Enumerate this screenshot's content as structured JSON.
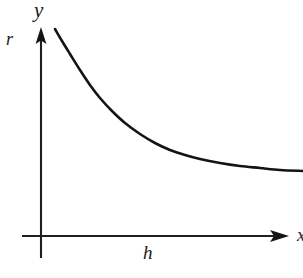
{
  "figure": {
    "background_color": "#ffffff",
    "ink_color": "#1a1a1a",
    "width": 303,
    "height": 278
  },
  "labels": {
    "y_axis_top": "y",
    "y_axis_side": "r",
    "x_axis_under": "h",
    "x_axis_end": "x"
  },
  "chart_data": {
    "type": "line",
    "title": "",
    "xlabel": "h",
    "ylabel": "r",
    "axis_tip_labels": {
      "vertical": "y",
      "horizontal": "x"
    },
    "grid": false,
    "legend": false,
    "ticks": {
      "x": [],
      "y": []
    },
    "origin_px": {
      "x": 41,
      "y": 236
    },
    "xlim_px": [
      22,
      288
    ],
    "ylim_px": [
      30,
      258
    ],
    "series": [
      {
        "name": "curve",
        "stroke": "#141414",
        "stroke_width": 2.6,
        "points_px": [
          {
            "x": 55,
            "y": 29
          },
          {
            "x": 62,
            "y": 41
          },
          {
            "x": 70,
            "y": 54
          },
          {
            "x": 80,
            "y": 70
          },
          {
            "x": 90,
            "y": 85
          },
          {
            "x": 100,
            "y": 98
          },
          {
            "x": 112,
            "y": 111
          },
          {
            "x": 125,
            "y": 123
          },
          {
            "x": 140,
            "y": 134
          },
          {
            "x": 155,
            "y": 143
          },
          {
            "x": 170,
            "y": 150
          },
          {
            "x": 185,
            "y": 155
          },
          {
            "x": 200,
            "y": 159
          },
          {
            "x": 220,
            "y": 163
          },
          {
            "x": 240,
            "y": 166
          },
          {
            "x": 260,
            "y": 168
          },
          {
            "x": 280,
            "y": 170
          },
          {
            "x": 303,
            "y": 171
          }
        ]
      }
    ]
  }
}
